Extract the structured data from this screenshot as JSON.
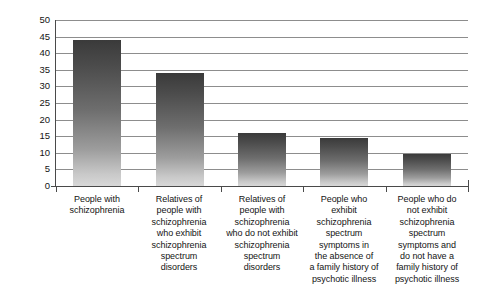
{
  "chart_data": {
    "type": "bar",
    "title": "",
    "subtitle": "",
    "xlabel": "",
    "ylabel": "Percentage abnormal",
    "ylim": [
      0,
      50
    ],
    "yticks": [
      0,
      5,
      10,
      15,
      20,
      25,
      30,
      35,
      40,
      45,
      50
    ],
    "ytick_labels": [
      "0",
      "5",
      "10",
      "15",
      "20",
      "25",
      "30",
      "35",
      "40",
      "45",
      "50"
    ],
    "grid": true,
    "legend": false,
    "legend_position": "none",
    "categories": [
      "People with schizophrenia",
      "Relatives of people with schizophrenia who exhibit schizophrenia spectrum disorders",
      "Relatives of people with schizophrenia who do not exhibit schizophrenia spectrum disorders",
      "People who exhibit schizophrenia spectrum symptoms in the absence of a family history of psychotic illness",
      "People who do not exhibit schizophrenia spectrum symptoms and do not have a family history of psychotic illness"
    ],
    "category_lines": [
      [
        "People with",
        "schizophrenia"
      ],
      [
        "Relatives of",
        "people with",
        "schizophrenia",
        "who exhibit",
        "schizophrenia",
        "spectrum",
        "disorders"
      ],
      [
        "Relatives of",
        "people with",
        "schizophrenia",
        "who do not exhibit",
        "schizophrenia",
        "spectrum",
        "disorders"
      ],
      [
        "People who",
        "exhibit",
        "schizophrenia",
        "spectrum",
        "symptoms in",
        "the absence of",
        "a family history of",
        "psychotic illness"
      ],
      [
        "People who do",
        "not exhibit",
        "schizophrenia",
        "spectrum",
        "symptoms and",
        "do not have a",
        "family history of",
        "psychotic illness"
      ]
    ],
    "values": [
      44,
      34,
      16,
      14.5,
      9.5
    ],
    "series": [
      {
        "name": "Percentage abnormal",
        "values": [
          44,
          34,
          16,
          14.5,
          9.5
        ]
      }
    ]
  },
  "style": {
    "bar_color_top": "#3a3a3a",
    "bar_color_bottom": "#d8d8d8",
    "gridline_color": "#8d8d8d",
    "axis_color": "#4a4a4a",
    "text_color": "#141414",
    "background": "#ffffff"
  }
}
